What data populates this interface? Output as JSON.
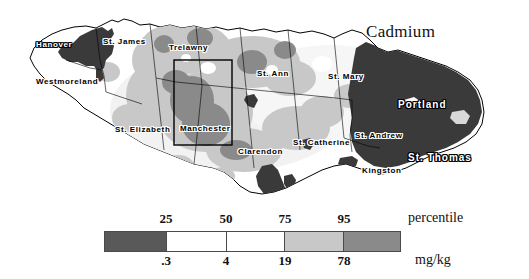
{
  "title": "Cadmium",
  "map": {
    "region": "Jamaica",
    "parishes": [
      {
        "name": "Hanover",
        "x": 36,
        "y": 40,
        "style": "dark",
        "size": "normal"
      },
      {
        "name": "St. James",
        "x": 103,
        "y": 37,
        "style": "light",
        "size": "normal"
      },
      {
        "name": "Westmoreland",
        "x": 36,
        "y": 77,
        "style": "light",
        "size": "normal"
      },
      {
        "name": "Trelawny",
        "x": 169,
        "y": 43,
        "style": "light",
        "size": "normal"
      },
      {
        "name": "St. Ann",
        "x": 257,
        "y": 69,
        "style": "light",
        "size": "normal"
      },
      {
        "name": "St. Mary",
        "x": 328,
        "y": 72,
        "style": "light",
        "size": "normal"
      },
      {
        "name": "Portland",
        "x": 398,
        "y": 99,
        "style": "dark",
        "size": "big"
      },
      {
        "name": "St. Elizabeth",
        "x": 115,
        "y": 125,
        "style": "light",
        "size": "normal"
      },
      {
        "name": "Manchester",
        "x": 180,
        "y": 124,
        "style": "light",
        "size": "normal"
      },
      {
        "name": "Clarendon",
        "x": 238,
        "y": 147,
        "style": "light",
        "size": "normal"
      },
      {
        "name": "St. Catherine",
        "x": 293,
        "y": 138,
        "style": "light",
        "size": "normal"
      },
      {
        "name": "St. Andrew",
        "x": 355,
        "y": 131,
        "style": "light",
        "size": "normal"
      },
      {
        "name": "St. Thomas",
        "x": 408,
        "y": 152,
        "style": "dark",
        "size": "big"
      },
      {
        "name": "Kingston",
        "x": 362,
        "y": 166,
        "style": "light",
        "size": "normal"
      }
    ],
    "inset_box": {
      "x": 174,
      "y": 60,
      "width": 58,
      "height": 85
    }
  },
  "chart_data": {
    "type": "map",
    "title": "Cadmium",
    "variable": "Cadmium",
    "unit": "mg/kg",
    "scale_type": "percentile",
    "legend": {
      "top_axis_label": "percentile",
      "bottom_axis_label": "mg/kg",
      "percentile_ticks": [
        "25",
        "50",
        "75",
        "95"
      ],
      "value_ticks": [
        ".3",
        "4",
        "19",
        "78"
      ],
      "classes": [
        {
          "percentile_range": "0-25",
          "value_range": "<.3",
          "color": "#595959"
        },
        {
          "percentile_range": "25-50",
          "value_range": ".3-4",
          "color": "#ffffff"
        },
        {
          "percentile_range": "50-75",
          "value_range": "4-19",
          "color": "#ffffff"
        },
        {
          "percentile_range": "75-95",
          "value_range": "19-78",
          "color": "#c8c8c8"
        },
        {
          "percentile_range": "95-100",
          "value_range": ">78",
          "color": "#8a8a8a"
        }
      ]
    }
  },
  "legend": {
    "unit_top": "percentile",
    "unit_bottom": "mg/kg",
    "ticks_top": [
      {
        "label": "25",
        "x": 166
      },
      {
        "label": "50",
        "x": 226
      },
      {
        "label": "75",
        "x": 285
      },
      {
        "label": "95",
        "x": 344
      }
    ],
    "ticks_bottom": [
      {
        "label": ".3",
        "x": 166
      },
      {
        "label": "4",
        "x": 226
      },
      {
        "label": "19",
        "x": 285
      },
      {
        "label": "78",
        "x": 344
      }
    ],
    "segments": [
      {
        "color": "#595959",
        "flex": 62
      },
      {
        "color": "#ffffff",
        "flex": 60
      },
      {
        "color": "#ffffff",
        "flex": 59
      },
      {
        "color": "#c8c8c8",
        "flex": 59
      },
      {
        "color": "#8a8a8a",
        "flex": 57
      }
    ]
  },
  "colors": {
    "darkest": "#3a3a3a",
    "dark": "#595959",
    "mid": "#8a8a8a",
    "light": "#c8c8c8",
    "lighter": "#e2e2e2",
    "white": "#ffffff",
    "outline": "#000000"
  }
}
